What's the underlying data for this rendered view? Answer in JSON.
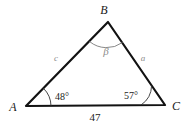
{
  "figure": {
    "kind": "triangle-diagram",
    "vertices": {
      "A": {
        "label": "A",
        "x": 26,
        "y": 106
      },
      "B": {
        "label": "B",
        "x": 108,
        "y": 22
      },
      "C": {
        "label": "C",
        "x": 165,
        "y": 105
      }
    },
    "angles": {
      "at_A": "48°",
      "at_B": "β",
      "at_C": "57°"
    },
    "sides": {
      "left": "c",
      "right": "a",
      "base": "47"
    },
    "colors": {
      "stroke": "#121212",
      "text": "#1a1a1a",
      "muted_text": "#8c8c8c",
      "background": "#ffffff",
      "arc": "#333333",
      "arc_muted": "#7a7a7a"
    }
  }
}
